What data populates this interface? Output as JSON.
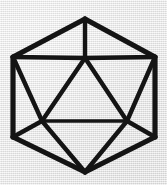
{
  "figure": {
    "caption": "",
    "shape_name": "icosahedron",
    "projection": "hexagonal-outline",
    "background_color": "#eaeaea",
    "stroke_color": "#141414",
    "canvas": {
      "width": 167,
      "height": 185
    }
  },
  "geometry": {
    "vertices": [
      {
        "id": "top-apex",
        "x": 85,
        "y": 19
      },
      {
        "id": "hex-upper-left",
        "x": 13,
        "y": 57
      },
      {
        "id": "hex-upper-right",
        "x": 155,
        "y": 57
      },
      {
        "id": "hex-lower-left",
        "x": 13,
        "y": 137
      },
      {
        "id": "hex-lower-right",
        "x": 155,
        "y": 137
      },
      {
        "id": "bottom-apex",
        "x": 85,
        "y": 172
      },
      {
        "id": "inner-top",
        "x": 85,
        "y": 58
      },
      {
        "id": "inner-lower-left",
        "x": 42,
        "y": 121
      },
      {
        "id": "inner-lower-right",
        "x": 127,
        "y": 121
      }
    ],
    "edges": [
      {
        "from": "top-apex",
        "to": "hex-upper-left",
        "weight": "outer"
      },
      {
        "from": "top-apex",
        "to": "hex-upper-right",
        "weight": "outer"
      },
      {
        "from": "hex-upper-left",
        "to": "hex-lower-left",
        "weight": "outer"
      },
      {
        "from": "hex-upper-right",
        "to": "hex-lower-right",
        "weight": "outer"
      },
      {
        "from": "hex-lower-left",
        "to": "bottom-apex",
        "weight": "outer"
      },
      {
        "from": "hex-lower-right",
        "to": "bottom-apex",
        "weight": "outer"
      },
      {
        "from": "hex-upper-left",
        "to": "inner-top",
        "weight": "inner"
      },
      {
        "from": "inner-top",
        "to": "hex-upper-right",
        "weight": "inner"
      },
      {
        "from": "top-apex",
        "to": "inner-top",
        "weight": "inner"
      },
      {
        "from": "inner-top",
        "to": "inner-lower-left",
        "weight": "inner"
      },
      {
        "from": "inner-top",
        "to": "inner-lower-right",
        "weight": "inner"
      },
      {
        "from": "inner-lower-left",
        "to": "inner-lower-right",
        "weight": "thin"
      },
      {
        "from": "hex-upper-left",
        "to": "inner-lower-left",
        "weight": "inner"
      },
      {
        "from": "hex-upper-right",
        "to": "inner-lower-right",
        "weight": "inner"
      },
      {
        "from": "hex-lower-left",
        "to": "inner-lower-left",
        "weight": "inner"
      },
      {
        "from": "hex-lower-right",
        "to": "inner-lower-right",
        "weight": "inner"
      },
      {
        "from": "inner-lower-left",
        "to": "bottom-apex",
        "weight": "inner"
      },
      {
        "from": "inner-lower-right",
        "to": "bottom-apex",
        "weight": "inner"
      }
    ],
    "counts": {
      "drawn_vertices": 9,
      "drawn_edges": 18
    }
  }
}
